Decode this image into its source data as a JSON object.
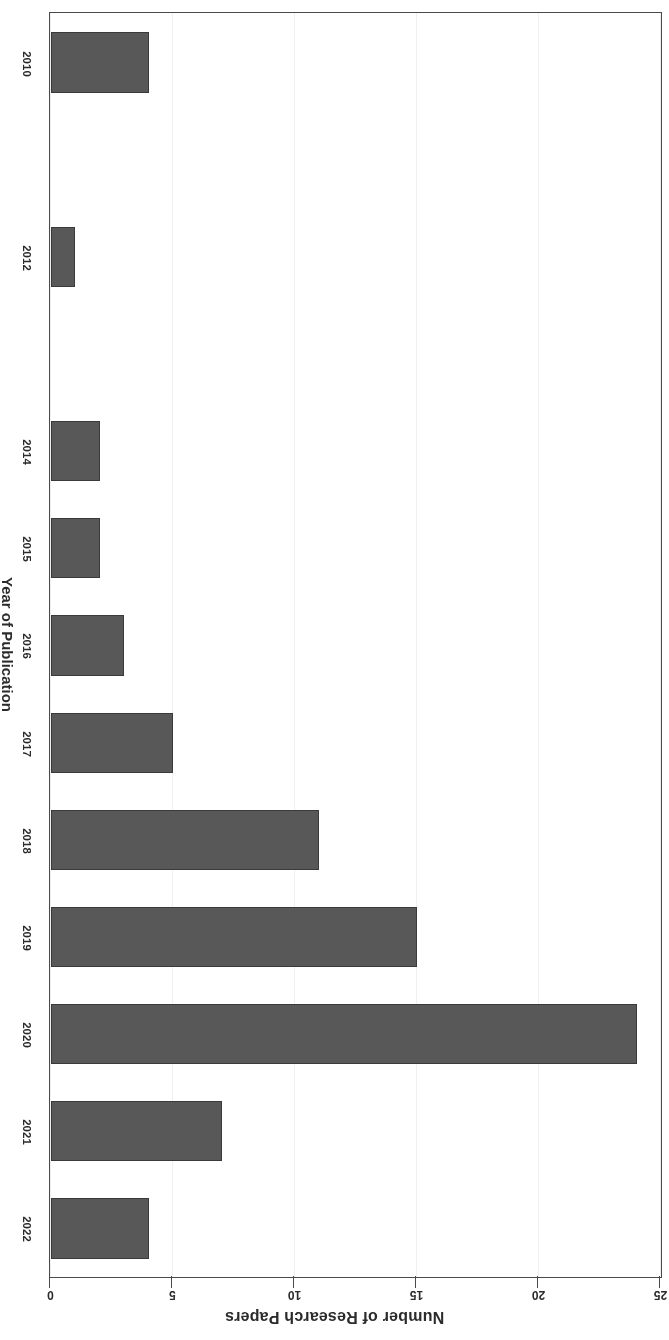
{
  "chart_data": {
    "type": "bar",
    "orientation": "horizontal",
    "title": "",
    "xlabel": "Year of Publication",
    "ylabel": "Number of Research Papers",
    "categories": [
      "2010",
      "2011",
      "2012",
      "2013",
      "2014",
      "2015",
      "2016",
      "2017",
      "2018",
      "2019",
      "2020",
      "2021",
      "2022"
    ],
    "values": [
      4,
      0,
      1,
      0,
      2,
      2,
      3,
      5,
      11,
      15,
      24,
      7,
      4
    ],
    "visible_category_labels": [
      "2010",
      "2012",
      "2014",
      "2015",
      "2016",
      "2017",
      "2018",
      "2019",
      "2020",
      "2021",
      "2022"
    ],
    "value_axis_ticks": [
      0,
      5,
      10,
      15,
      20,
      25
    ],
    "value_axis_tick_labels": [
      "0",
      "5",
      "10",
      "15",
      "20",
      "25"
    ],
    "ylim": [
      0,
      25
    ],
    "grid": true,
    "legend": null,
    "legend_position": "none",
    "rotation_degrees": 180,
    "series": [
      {
        "name": "Number of Research Papers",
        "values": [
          4,
          0,
          1,
          0,
          2,
          2,
          3,
          5,
          11,
          15,
          24,
          7,
          4
        ]
      }
    ]
  },
  "style": {
    "bar_fill": "#585858",
    "bar_edge": "#3a3a3a",
    "axis_color": "#4a4a4a",
    "grid_color": "#f0f0f0",
    "text_color": "#2b2b2b",
    "background": "#ffffff"
  }
}
